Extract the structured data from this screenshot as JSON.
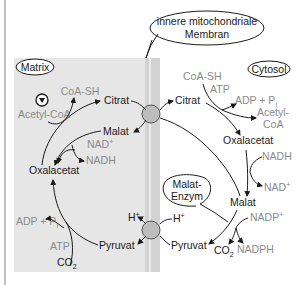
{
  "diagram": {
    "regions": {
      "matrix": "Matrix",
      "cytosol": "Cytosol"
    },
    "callouts": {
      "membrane_line1": "innere mitochondriale",
      "membrane_line2": "Membran",
      "malic_line1": "Malat-",
      "malic_line2": "Enzym"
    },
    "matrix_labels": {
      "coa_sh": "CoA-SH",
      "acetyl_coa": "Acetyl-CoA",
      "citrat": "Citrat",
      "malat": "Malat",
      "nad_plus": "NAD",
      "nadh": "NADH",
      "oxalacetat": "Oxalacetat",
      "adp_pi": "ADP + P",
      "atp": "ATP",
      "co2": "CO",
      "pyruvat": "Pyruvat",
      "h_plus": "H"
    },
    "cytosol_labels": {
      "citrat": "Citrat",
      "coa_sh": "CoA-SH",
      "atp": "ATP",
      "adp_pi": "ADP + P",
      "acetyl_coa_1": "Acetyl-",
      "acetyl_coa_2": "CoA",
      "oxalacetat": "Oxalacetat",
      "nadh": "NADH",
      "nad_plus": "NAD",
      "malat": "Malat",
      "nadp_plus": "NADP",
      "nadph": "NADPH",
      "co2": "CO",
      "pyruvat": "Pyruvat",
      "h_plus": "H"
    },
    "sub": {
      "i": "i",
      "two": "2",
      "plus": "+"
    },
    "colors": {
      "matrix_bg": "#e6e6e6",
      "membrane": "#d2d2d2",
      "transporter": "#bdbdbd",
      "text_dark": "#1a1a1a",
      "text_gray": "#8a8a8a"
    }
  }
}
